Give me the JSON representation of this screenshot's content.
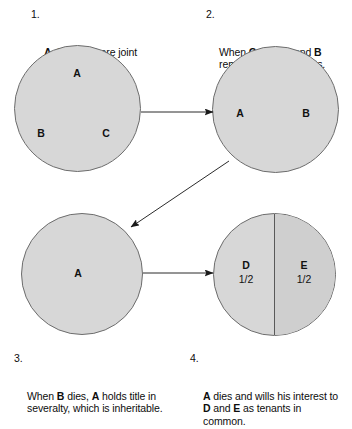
{
  "diagram": {
    "title_semantics": "joint-tenancy-succession-diagram",
    "background_color": "#ffffff",
    "circle_fill": "#d7d7d7",
    "circle_fill_alt": "#cfcfcf",
    "circle_stroke": "#6d6d6d",
    "text_color": "#111111"
  },
  "captions": [
    {
      "number": "1.",
      "text_plain": "A, B, and C are joint tenants.",
      "segments": [
        {
          "t": "A",
          "b": true
        },
        {
          "t": ", ",
          "b": false
        },
        {
          "t": "B",
          "b": true
        },
        {
          "t": ", and ",
          "b": false
        },
        {
          "t": "C",
          "b": true
        },
        {
          "t": " are joint tenants.",
          "b": false
        }
      ]
    },
    {
      "number": "2.",
      "text_plain": "When C dies, A and B remain as joint tenants.",
      "segments": [
        {
          "t": "When ",
          "b": false
        },
        {
          "t": "C",
          "b": true
        },
        {
          "t": " dies, ",
          "b": false
        },
        {
          "t": "A",
          "b": true
        },
        {
          "t": " and ",
          "b": false
        },
        {
          "t": "B",
          "b": true
        },
        {
          "t": " remain as joint tenants.",
          "b": false
        }
      ]
    },
    {
      "number": "3.",
      "text_plain": "When B dies, A holds title in severalty, which is inheritable.",
      "segments": [
        {
          "t": "When ",
          "b": false
        },
        {
          "t": "B",
          "b": true
        },
        {
          "t": " dies, ",
          "b": false
        },
        {
          "t": "A",
          "b": true
        },
        {
          "t": " holds title in severalty, which is inheritable.",
          "b": false
        }
      ]
    },
    {
      "number": "4.",
      "text_plain": "A dies and wills his interest to D and E as tenants in common.",
      "segments": [
        {
          "t": "A",
          "b": true
        },
        {
          "t": " dies and wills his interest to ",
          "b": false
        },
        {
          "t": "D",
          "b": true
        },
        {
          "t": " and ",
          "b": false
        },
        {
          "t": "E",
          "b": true
        },
        {
          "t": " as tenants in common.",
          "b": false
        }
      ]
    }
  ],
  "circles": {
    "circle_1": {
      "name": "three-joint-tenants",
      "labels": [
        {
          "key": "a",
          "text": "A"
        },
        {
          "key": "b",
          "text": "B"
        },
        {
          "key": "c",
          "text": "C"
        }
      ]
    },
    "circle_2": {
      "name": "two-joint-tenants",
      "labels": [
        {
          "key": "a",
          "text": "A"
        },
        {
          "key": "b",
          "text": "B"
        }
      ]
    },
    "circle_3": {
      "name": "sole-ownership-severalty",
      "labels": [
        {
          "key": "a",
          "text": "A"
        }
      ]
    },
    "circle_4": {
      "name": "tenants-in-common-split",
      "split": true,
      "labels": [
        {
          "key": "d",
          "text": "D",
          "share": "1/2"
        },
        {
          "key": "e",
          "text": "E",
          "share": "1/2"
        }
      ]
    }
  },
  "arrows": [
    {
      "name": "arrow-circle1-to-circle2",
      "direction": "right"
    },
    {
      "name": "arrow-circle2-to-circle3",
      "direction": "down-left"
    },
    {
      "name": "arrow-circle3-to-circle4",
      "direction": "right"
    }
  ]
}
